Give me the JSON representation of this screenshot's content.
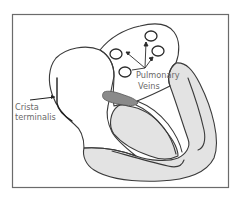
{
  "figure": {
    "labels": {
      "crista_line1": "Crista",
      "crista_line2": "terminalis",
      "pulmonary_line1": "Pulmonary",
      "pulmonary_line2": "Veins"
    },
    "colors": {
      "frame": "#6b6b6b",
      "outline": "#3a3a3a",
      "myocardium_fill": "#e3e3e3",
      "septum_fill": "#8a8a8a",
      "label_text": "#6a6a6a",
      "background": "#ffffff"
    },
    "pulmonary_vein_count": 4
  }
}
